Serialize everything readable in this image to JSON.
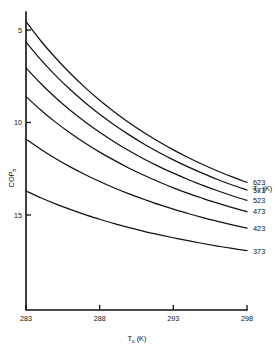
{
  "chart_data": {
    "type": "line",
    "title": "",
    "xlabel": "Tc (K)",
    "xlabel_main": "T",
    "xlabel_sub": "c",
    "xlabel_unit": " (K)",
    "ylabel": "COPh",
    "ylabel_main": "COP",
    "ylabel_sub": "h",
    "xlim": [
      283,
      298
    ],
    "ylim": [
      0,
      16
    ],
    "xticks": [
      283,
      288,
      293,
      298
    ],
    "yticks": [
      5,
      10,
      15
    ],
    "grid": false,
    "legend_position": "right-outside",
    "legend_title": "Th (K)",
    "legend_title_main": "T",
    "legend_title_sub": "h",
    "legend_title_unit": " (K)",
    "x": [
      283,
      284,
      285,
      286,
      287,
      288,
      289,
      290,
      291,
      292,
      293,
      294,
      295,
      296,
      297,
      298
    ],
    "series": [
      {
        "name": "623",
        "label": "623",
        "values": [
          15.45,
          14.42,
          13.5,
          12.66,
          11.9,
          11.2,
          10.57,
          9.99,
          9.46,
          8.97,
          8.52,
          8.11,
          7.73,
          7.38,
          7.06,
          6.76
        ]
      },
      {
        "name": "573",
        "label": "573",
        "values": [
          14.35,
          13.4,
          12.55,
          11.78,
          11.08,
          10.44,
          9.86,
          9.33,
          8.84,
          8.39,
          7.98,
          7.6,
          7.25,
          6.92,
          6.62,
          6.35
        ]
      },
      {
        "name": "523",
        "label": "523",
        "values": [
          12.95,
          12.11,
          11.35,
          10.66,
          10.04,
          9.47,
          8.95,
          8.47,
          8.03,
          7.63,
          7.26,
          6.92,
          6.6,
          6.31,
          6.04,
          5.79
        ]
      },
      {
        "name": "473",
        "label": "473",
        "values": [
          11.4,
          10.68,
          10.02,
          9.43,
          8.89,
          8.4,
          7.95,
          7.53,
          7.15,
          6.8,
          6.47,
          6.17,
          5.9,
          5.64,
          5.4,
          5.18
        ]
      },
      {
        "name": "423",
        "label": "423",
        "values": [
          9.1,
          8.55,
          8.05,
          7.6,
          7.19,
          6.81,
          6.46,
          6.14,
          5.85,
          5.57,
          5.32,
          5.08,
          4.86,
          4.66,
          4.47,
          4.29
        ]
      },
      {
        "name": "373",
        "label": "373",
        "values": [
          6.3,
          5.93,
          5.6,
          5.3,
          5.02,
          4.77,
          4.53,
          4.32,
          4.12,
          3.94,
          3.77,
          3.61,
          3.46,
          3.32,
          3.19,
          3.07
        ]
      }
    ]
  },
  "legend": {
    "title_main": "T",
    "title_sub": "h",
    "title_unit": " (K)",
    "entries": [
      "623",
      "573",
      "523",
      "473",
      "423",
      "373"
    ]
  },
  "axes": {
    "x_tick_labels": [
      "283",
      "288",
      "293",
      "298"
    ],
    "y_tick_labels": [
      "15",
      "10",
      "5"
    ],
    "x_title_main": "T",
    "x_title_sub": "c",
    "x_title_unit": " (K)",
    "y_title_main": "COP",
    "y_title_sub": "h"
  },
  "colors": {
    "curve": "#111111",
    "axis": "#111111",
    "background": "#ffffff"
  }
}
